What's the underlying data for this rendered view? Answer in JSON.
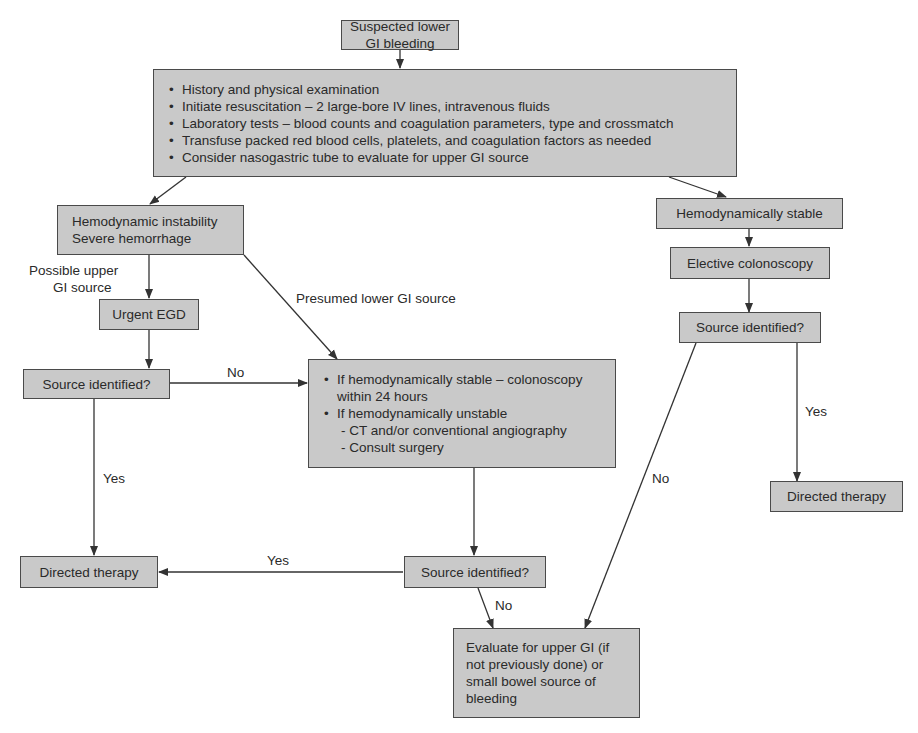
{
  "diagram": {
    "type": "flowchart",
    "title": "Suspected lower GI bleeding",
    "colors": {
      "box_fill": "#c9c9c9",
      "box_border": "#4a4a4a",
      "line": "#333333",
      "text": "#2a2a2a"
    },
    "nodes": {
      "start": {
        "text": "Suspected lower GI bleeding"
      },
      "initial": {
        "items": [
          "History and physical examination",
          "Initiate resuscitation – 2 large-bore IV lines, intravenous fluids",
          "Laboratory tests – blood counts and coagulation parameters, type and crossmatch",
          "Transfuse packed red blood cells, platelets, and coagulation factors as needed",
          "Consider nasogastric tube to evaluate for upper GI source"
        ]
      },
      "unstable": {
        "line1": "Hemodynamic instability",
        "line2": "Severe hemorrhage"
      },
      "stable": {
        "text": "Hemodynamically stable"
      },
      "elective": {
        "text": "Elective colonoscopy"
      },
      "egd": {
        "text": "Urgent EGD"
      },
      "source_left": {
        "text": "Source identified?"
      },
      "source_right": {
        "text": "Source identified?"
      },
      "management": {
        "item1_line1": "If hemodynamically stable – colonoscopy",
        "item1_line2": "within 24 hours",
        "item2": "If hemodynamically unstable",
        "sub1": "- CT and/or conventional angiography",
        "sub2": "- Consult surgery"
      },
      "source_mid": {
        "text": "Source identified?"
      },
      "directed_left": {
        "text": "Directed therapy"
      },
      "directed_right": {
        "text": "Directed therapy"
      },
      "evaluate": {
        "text": "Evaluate for upper GI (if not previously done) or small bowel source of bleeding"
      }
    },
    "edge_labels": {
      "possible_upper_1": "Possible upper",
      "possible_upper_2": "GI source",
      "presumed_lower": "Presumed lower GI source",
      "no_left": "No",
      "yes_left": "Yes",
      "yes_mid": "Yes",
      "no_mid": "No",
      "no_right": "No",
      "yes_right": "Yes"
    }
  }
}
